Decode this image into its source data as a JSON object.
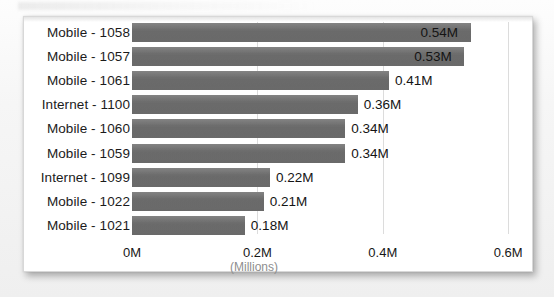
{
  "chart_data": {
    "type": "bar",
    "orientation": "horizontal",
    "title": "",
    "subtitle": "",
    "xlabel": "(Millions)",
    "ylabel": "",
    "categories": [
      "Mobile - 1058",
      "Mobile - 1057",
      "Mobile - 1061",
      "Internet - 1100",
      "Mobile - 1060",
      "Mobile - 1059",
      "Internet - 1099",
      "Mobile - 1022",
      "Mobile - 1021"
    ],
    "values": [
      0.54,
      0.53,
      0.41,
      0.36,
      0.34,
      0.34,
      0.22,
      0.21,
      0.18
    ],
    "data_labels": [
      "0.54M",
      "0.53M",
      "0.41M",
      "0.36M",
      "0.34M",
      "0.34M",
      "0.22M",
      "0.21M",
      "0.18M"
    ],
    "label_placement": [
      "inside",
      "inside",
      "outside",
      "outside",
      "outside",
      "outside",
      "outside",
      "outside",
      "outside"
    ],
    "xlim": [
      0,
      0.6
    ],
    "xticks": [
      0,
      0.2,
      0.4,
      0.6
    ],
    "xtick_labels": [
      "0M",
      "0.2M",
      "0.4M",
      "0.6M"
    ],
    "grid": "vertical",
    "legend": "none",
    "bar_color": "#6e6e6e",
    "plot_background": "#ffffff",
    "gridline_color": "#dcdcdc",
    "axis_title_color": "#8e8e8e"
  }
}
